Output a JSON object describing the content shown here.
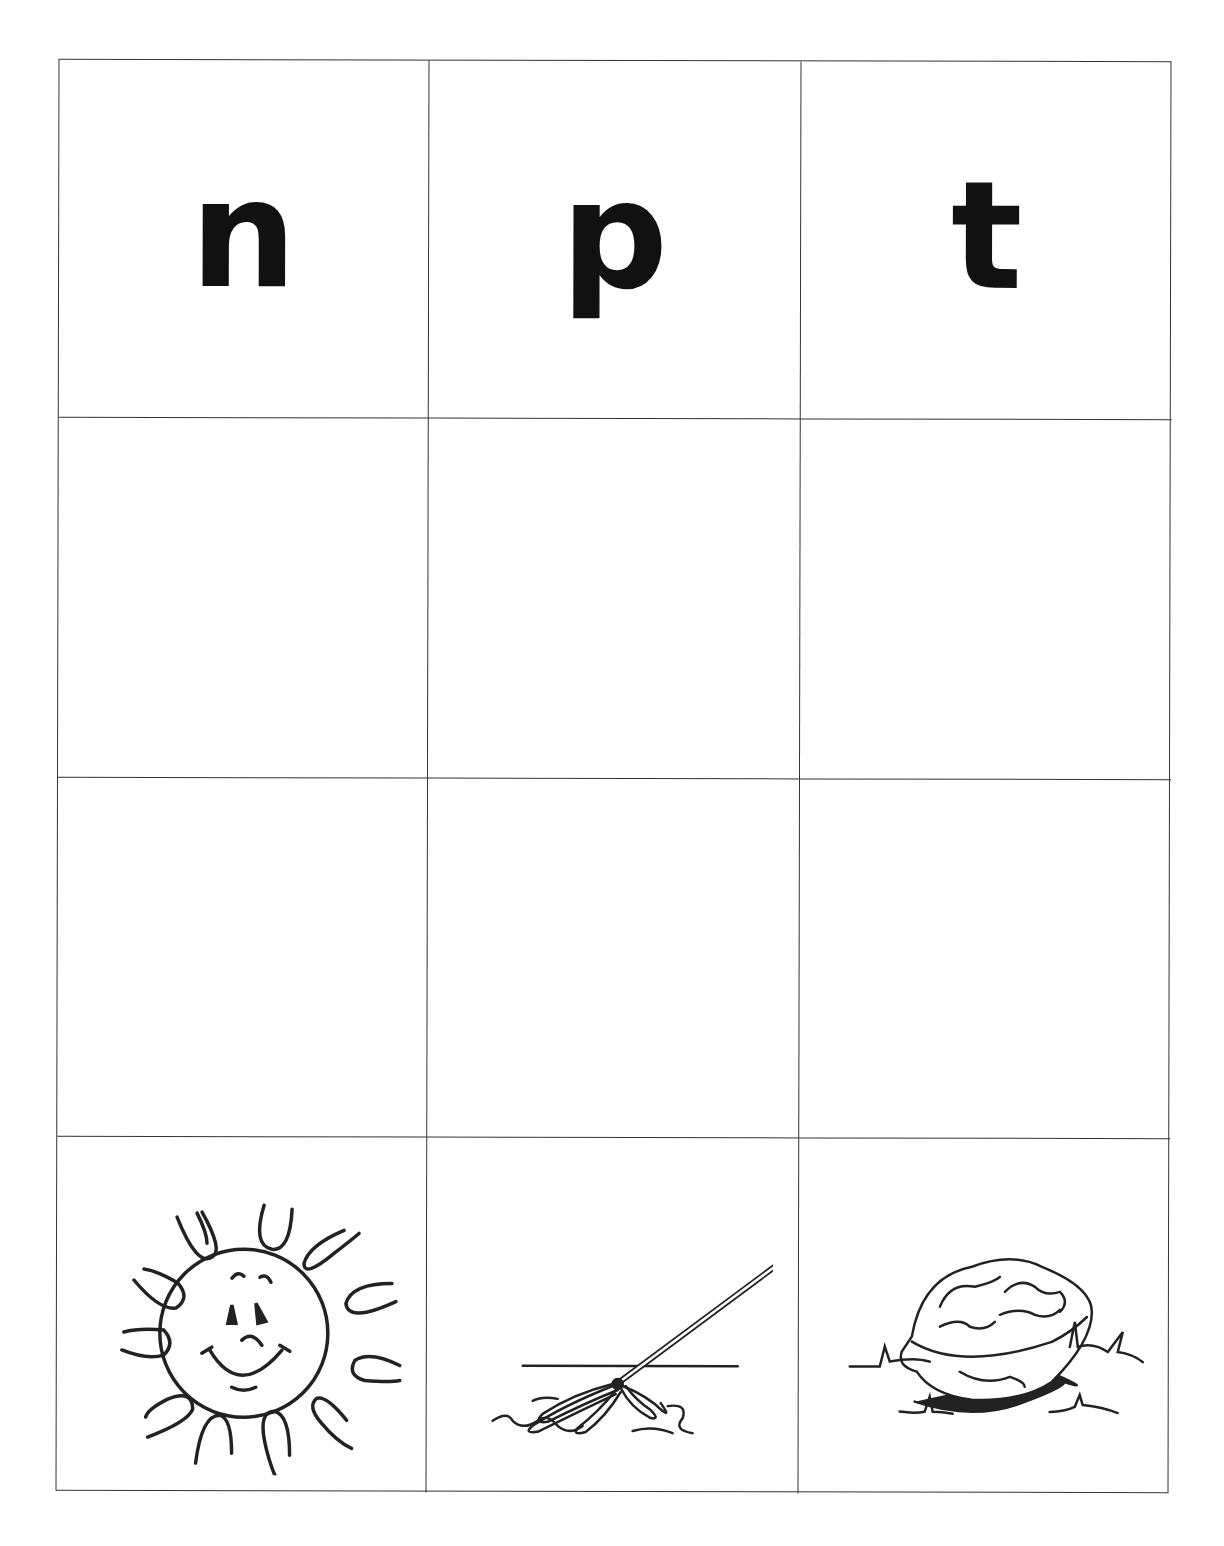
{
  "worksheet": {
    "header_letters": [
      {
        "letter": "n"
      },
      {
        "letter": "p"
      },
      {
        "letter": "t"
      }
    ],
    "empty_rows": 2,
    "pictures": [
      {
        "name": "sun",
        "icon": "sun-icon"
      },
      {
        "name": "mop",
        "icon": "mop-icon"
      },
      {
        "name": "nut",
        "icon": "nut-icon"
      }
    ]
  },
  "colors": {
    "line": "#333333",
    "ink": "#111111",
    "background": "#ffffff"
  }
}
